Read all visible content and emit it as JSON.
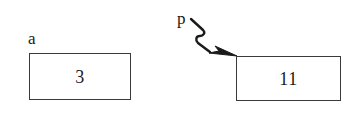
{
  "canvas": {
    "width": 354,
    "height": 123,
    "background_color": "#ffffff",
    "ink_color": "#1a1a1a",
    "border_color": "#3a3a3a"
  },
  "diagram": {
    "type": "pointer-variable-diagram",
    "variables": [
      {
        "id": "a",
        "label": "a",
        "kind": "value-box",
        "value": "3",
        "box": {
          "x": 29,
          "y": 53,
          "width": 102,
          "height": 47
        },
        "label_position": "above-left"
      },
      {
        "id": "p",
        "label": "p",
        "kind": "pointer",
        "points_to": "target-box",
        "label_position": "above-left-of-arrow"
      }
    ],
    "target_box": {
      "id": "target-box",
      "value": "11",
      "box": {
        "x": 236,
        "y": 56,
        "width": 105,
        "height": 45
      }
    },
    "arrow": {
      "id": "pointer-arrow",
      "style": "squiggly",
      "head": "solid-filled-triangle",
      "from": {
        "x": 191,
        "y": 19
      },
      "to": {
        "x": 237,
        "y": 56
      },
      "stroke_width": 2.4,
      "color": "#1a1a1a"
    }
  }
}
